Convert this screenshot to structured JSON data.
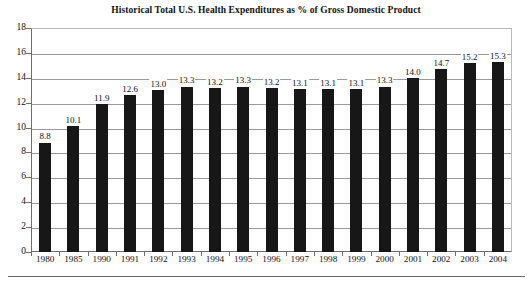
{
  "chart_data": {
    "type": "bar",
    "title": "Historical Total U.S. Health Expenditures as % of Gross Domestic Product",
    "xlabel": "",
    "ylabel": "",
    "ylim": [
      0,
      18
    ],
    "ytick_step": 2,
    "yticks": [
      0,
      2,
      4,
      6,
      8,
      10,
      12,
      14,
      16,
      18
    ],
    "grid": true,
    "legend": "none",
    "bar_color": "#171717",
    "gridline_color": "#9a9a9a",
    "axis_color": "#6e6e6e",
    "categories": [
      "1980",
      "1985",
      "1990",
      "1991",
      "1992",
      "1993",
      "1994",
      "1995",
      "1996",
      "1997",
      "1998",
      "1999",
      "2000",
      "2001",
      "2002",
      "2003",
      "2004"
    ],
    "values": [
      8.8,
      10.1,
      11.9,
      12.6,
      13.0,
      13.3,
      13.2,
      13.3,
      13.2,
      13.1,
      13.1,
      13.1,
      13.3,
      14.0,
      14.7,
      15.2,
      15.3
    ],
    "data_labels": [
      "8.8",
      "10.1",
      "11.9",
      "12.6",
      "13.0",
      "13.3",
      "13.2",
      "13.3",
      "13.2",
      "13.1",
      "13.1",
      "13.1",
      "13.3",
      "14.0",
      "14.7",
      "15.2",
      "15.3"
    ]
  }
}
